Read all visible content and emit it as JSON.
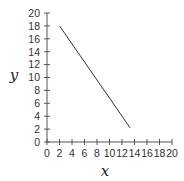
{
  "chart_data": {
    "type": "line",
    "title": "",
    "xlabel": "x",
    "ylabel": "y",
    "xlim": [
      0,
      20
    ],
    "ylim": [
      0,
      20
    ],
    "xticks": [
      0,
      2,
      4,
      6,
      8,
      10,
      12,
      14,
      16,
      18,
      20
    ],
    "yticks": [
      0,
      2,
      4,
      6,
      8,
      10,
      12,
      14,
      16,
      18,
      20
    ],
    "grid": false,
    "legend": null,
    "series": [
      {
        "name": "line",
        "color": "#333333",
        "x": [
          2,
          13.3
        ],
        "y": [
          18,
          2.2
        ]
      }
    ]
  },
  "colors": {
    "axis": "#555555",
    "line": "#333333",
    "background": "#ffffff"
  }
}
